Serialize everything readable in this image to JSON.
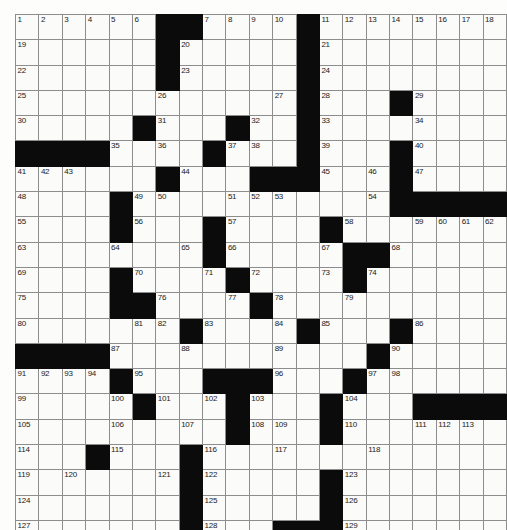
{
  "puzzle": {
    "title": "Crossword Grid",
    "columns": 21,
    "rows": 19,
    "block_color": "#0b0b0b",
    "cell_color": "#fbfbf9",
    "grid_line_color": "#8d8d8d",
    "border_color": "#2b2b2b",
    "max_clue_number": 129,
    "legend": {
      "block": "black-square",
      "open": "white-square"
    },
    "grid": [
      [
        {
          "n": "1"
        },
        {
          "n": "2"
        },
        {
          "n": "3"
        },
        {
          "n": "4"
        },
        {
          "n": "5"
        },
        {
          "n": "6"
        },
        {
          "b": true
        },
        {
          "b": true
        },
        {
          "n": "7"
        },
        {
          "n": "8"
        },
        {
          "n": "9"
        },
        {
          "n": "10"
        },
        {
          "b": true
        },
        {
          "n": "11"
        },
        {
          "n": "12"
        },
        {
          "n": "13"
        },
        {
          "n": "14"
        },
        {
          "n": "15"
        },
        {
          "n": "16"
        },
        {
          "n": "17"
        },
        {
          "n": "18"
        }
      ],
      [
        {
          "n": "19"
        },
        {},
        {},
        {},
        {},
        {},
        {
          "b": true
        },
        {
          "n": "20"
        },
        {},
        {},
        {},
        {},
        {
          "b": true
        },
        {
          "n": "21"
        },
        {},
        {},
        {},
        {},
        {},
        {},
        {}
      ],
      [
        {
          "n": "22"
        },
        {},
        {},
        {},
        {},
        {},
        {
          "b": true
        },
        {
          "n": "23"
        },
        {},
        {},
        {},
        {},
        {
          "b": true
        },
        {
          "n": "24"
        },
        {},
        {},
        {},
        {},
        {},
        {},
        {}
      ],
      [
        {
          "n": "25"
        },
        {},
        {},
        {},
        {},
        {},
        {
          "n": "26"
        },
        {},
        {},
        {},
        {},
        {
          "n": "27"
        },
        {
          "b": true
        },
        {
          "n": "28"
        },
        {},
        {},
        {
          "b": true
        },
        {
          "n": "29"
        },
        {},
        {},
        {}
      ],
      [
        {
          "n": "30"
        },
        {},
        {},
        {},
        {},
        {
          "b": true
        },
        {
          "n": "31"
        },
        {},
        {},
        {
          "b": true
        },
        {
          "n": "32"
        },
        {},
        {
          "b": true
        },
        {
          "n": "33"
        },
        {},
        {},
        {},
        {
          "n": "34"
        },
        {},
        {},
        {}
      ],
      [
        {
          "b": true
        },
        {
          "b": true
        },
        {
          "b": true
        },
        {
          "b": true
        },
        {
          "n": "35"
        },
        {},
        {
          "n": "36"
        },
        {},
        {
          "b": true
        },
        {
          "n": "37"
        },
        {
          "n": "38"
        },
        {},
        {
          "b": true
        },
        {
          "n": "39"
        },
        {},
        {},
        {
          "b": true
        },
        {
          "n": "40"
        },
        {},
        {},
        {}
      ],
      [
        {
          "n": "41"
        },
        {
          "n": "42"
        },
        {
          "n": "43"
        },
        {},
        {},
        {},
        {
          "b": true
        },
        {
          "n": "44"
        },
        {},
        {},
        {
          "b": true
        },
        {
          "b": true
        },
        {
          "b": true
        },
        {
          "n": "45"
        },
        {},
        {
          "n": "46"
        },
        {
          "b": true
        },
        {
          "n": "47"
        },
        {},
        {},
        {}
      ],
      [
        {
          "n": "48"
        },
        {},
        {},
        {},
        {
          "b": true
        },
        {
          "n": "49"
        },
        {
          "n": "50"
        },
        {},
        {},
        {
          "n": "51"
        },
        {
          "n": "52"
        },
        {
          "n": "53"
        },
        {},
        {},
        {},
        {
          "n": "54"
        },
        {
          "b": true
        },
        {
          "b": true
        },
        {
          "b": true
        },
        {
          "b": true
        },
        {
          "b": true
        }
      ],
      [
        {
          "n": "55"
        },
        {},
        {},
        {},
        {
          "b": true
        },
        {
          "n": "56"
        },
        {},
        {},
        {
          "b": true
        },
        {
          "n": "57"
        },
        {},
        {},
        {},
        {
          "b": true
        },
        {
          "n": "58"
        },
        {},
        {},
        {
          "n": "59"
        },
        {
          "n": "60"
        },
        {
          "n": "61"
        },
        {
          "n": "62"
        }
      ],
      [
        {
          "n": "63"
        },
        {},
        {},
        {},
        {
          "n": "64"
        },
        {},
        {},
        {
          "n": "65"
        },
        {
          "b": true
        },
        {
          "n": "66"
        },
        {},
        {},
        {},
        {
          "n": "67"
        },
        {
          "b": true
        },
        {
          "b": true
        },
        {
          "n": "68"
        },
        {},
        {},
        {},
        {}
      ],
      [
        {
          "n": "69"
        },
        {},
        {},
        {},
        {
          "b": true
        },
        {
          "n": "70"
        },
        {},
        {},
        {
          "n": "71"
        },
        {
          "b": true
        },
        {
          "n": "72"
        },
        {},
        {},
        {
          "n": "73"
        },
        {
          "b": true
        },
        {
          "n": "74"
        },
        {},
        {},
        {},
        {},
        {}
      ],
      [
        {
          "n": "75"
        },
        {},
        {},
        {},
        {
          "b": true
        },
        {
          "b": true
        },
        {
          "n": "76"
        },
        {},
        {},
        {
          "n": "77"
        },
        {
          "b": true
        },
        {
          "n": "78"
        },
        {},
        {},
        {
          "n": "79"
        },
        {},
        {},
        {},
        {},
        {},
        {}
      ],
      [
        {
          "n": "80"
        },
        {},
        {},
        {},
        {},
        {
          "n": "81"
        },
        {
          "n": "82"
        },
        {
          "b": true
        },
        {
          "n": "83"
        },
        {},
        {},
        {
          "n": "84"
        },
        {
          "b": true
        },
        {
          "n": "85"
        },
        {},
        {},
        {
          "b": true
        },
        {
          "n": "86"
        },
        {},
        {},
        {}
      ],
      [
        {
          "b": true
        },
        {
          "b": true
        },
        {
          "b": true
        },
        {
          "b": true
        },
        {
          "n": "87"
        },
        {},
        {},
        {
          "n": "88"
        },
        {},
        {},
        {},
        {
          "n": "89"
        },
        {},
        {},
        {},
        {
          "b": true
        },
        {
          "n": "90"
        },
        {},
        {},
        {},
        {}
      ],
      [
        {
          "n": "91"
        },
        {
          "n": "92"
        },
        {
          "n": "93"
        },
        {
          "n": "94"
        },
        {
          "b": true
        },
        {
          "n": "95"
        },
        {},
        {},
        {
          "b": true
        },
        {
          "b": true
        },
        {
          "b": true
        },
        {
          "n": "96"
        },
        {},
        {},
        {
          "b": true
        },
        {
          "n": "97"
        },
        {
          "n": "98"
        },
        {},
        {},
        {},
        {}
      ],
      [
        {
          "n": "99"
        },
        {},
        {},
        {},
        {
          "n": "100"
        },
        {
          "b": true
        },
        {
          "n": "101"
        },
        {},
        {
          "n": "102"
        },
        {
          "b": true
        },
        {
          "n": "103"
        },
        {},
        {},
        {
          "b": true
        },
        {
          "n": "104"
        },
        {},
        {},
        {
          "b": true
        },
        {
          "b": true
        },
        {
          "b": true
        },
        {
          "b": true
        }
      ],
      [
        {
          "n": "105"
        },
        {},
        {},
        {},
        {
          "n": "106"
        },
        {},
        {},
        {
          "n": "107"
        },
        {},
        {
          "b": true
        },
        {
          "n": "108"
        },
        {
          "n": "109"
        },
        {},
        {
          "b": true
        },
        {
          "n": "110"
        },
        {},
        {},
        {
          "n": "111"
        },
        {
          "n": "112"
        },
        {
          "n": "113"
        },
        {}
      ],
      [
        {
          "n": "114"
        },
        {},
        {},
        {
          "b": true
        },
        {
          "n": "115"
        },
        {},
        {},
        {
          "b": true
        },
        {
          "n": "116"
        },
        {},
        {},
        {
          "n": "117"
        },
        {},
        {},
        {},
        {
          "n": "118"
        },
        {},
        {},
        {},
        {},
        {}
      ],
      [
        {
          "n": "119"
        },
        {},
        {
          "n": "120"
        },
        {},
        {},
        {},
        {
          "n": "121"
        },
        {
          "b": true
        },
        {
          "n": "122"
        },
        {},
        {},
        {},
        {},
        {
          "b": true
        },
        {
          "n": "123"
        },
        {},
        {},
        {},
        {},
        {},
        {}
      ],
      [
        {
          "n": "124"
        },
        {},
        {},
        {},
        {},
        {},
        {},
        {
          "b": true
        },
        {
          "n": "125"
        },
        {},
        {},
        {},
        {},
        {
          "b": true
        },
        {
          "n": "126"
        },
        {},
        {},
        {},
        {},
        {},
        {}
      ],
      [
        {
          "n": "127"
        },
        {},
        {},
        {},
        {},
        {},
        {},
        {
          "b": true
        },
        {
          "n": "128"
        },
        {},
        {},
        {
          "b": true
        },
        {
          "b": true
        },
        {
          "b": true
        },
        {
          "n": "129"
        },
        {},
        {},
        {},
        {},
        {},
        {}
      ]
    ]
  }
}
